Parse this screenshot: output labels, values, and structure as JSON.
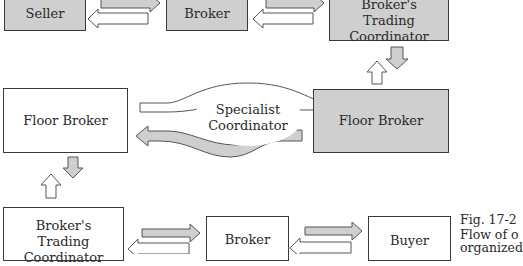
{
  "diagram": {
    "top_row": {
      "seller": "Seller",
      "broker": "Broker",
      "trading_coordinator": "Broker's\nTrading Coordinator"
    },
    "middle_row": {
      "floor_broker_left": "Floor Broker",
      "specialist": "Specialist\nCoordinator",
      "floor_broker_right": "Floor Broker"
    },
    "bottom_row": {
      "trading_coordinator": "Broker's\nTrading Coordinator",
      "broker": "Broker",
      "buyer": "Buyer"
    },
    "caption": {
      "line1": "Fig. 17-2",
      "line2": "Flow of o",
      "line3": "organized"
    },
    "colors": {
      "gray_fill": "#cfcfcf",
      "outline": "#3a3a3a",
      "white_fill": "#ffffff"
    }
  }
}
